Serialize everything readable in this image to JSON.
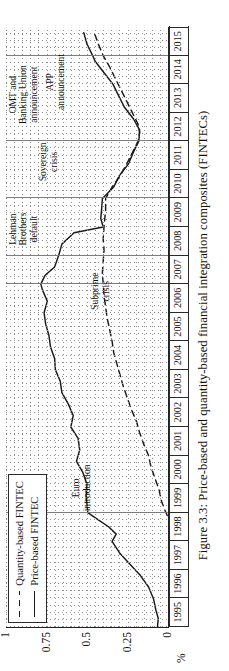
{
  "figure": {
    "caption": "Figure 3.3: Price-based and quantity-based financial integration composites (FINTECs)"
  },
  "legend": {
    "position": "upper-left",
    "items": [
      {
        "label": "Quantity-based FINTEC",
        "style": "dashed"
      },
      {
        "label": "Price-based FINTEC",
        "style": "solid"
      }
    ]
  },
  "annotations": [
    {
      "id": "euro-introduction",
      "text": "Euro\nintroduction",
      "year": 1999.05
    },
    {
      "id": "subprime-crisis",
      "text": "Subprime\ncrisis",
      "year": 2006.1
    },
    {
      "id": "lehman-brothers-default",
      "text": "Lehman\nBrothers\ndefault",
      "year": 2008.35
    },
    {
      "id": "sovereign-crisis",
      "text": "Sovereign\ncrisis",
      "year": 2010.6
    },
    {
      "id": "omt-banking-union",
      "text": "OMT and\nBanking Union\nannouncement",
      "year": 2012.6
    },
    {
      "id": "app-announcement",
      "text": "APP\nannouncement",
      "year": 2013.1
    }
  ],
  "chart_data": {
    "type": "line",
    "title": "",
    "xlabel": "",
    "ylabel": "%",
    "xlim": [
      1995,
      2016
    ],
    "ylim": [
      0,
      1
    ],
    "yticks": [
      0,
      0.25,
      0.5,
      0.75,
      1
    ],
    "ytick_labels": [
      "0",
      "0.25",
      "0.5",
      "0.75",
      "1"
    ],
    "categories": [
      "1995",
      "1996",
      "1997",
      "1998",
      "1999",
      "2000",
      "2001",
      "2002",
      "2003",
      "2004",
      "2005",
      "2006",
      "2007",
      "2008",
      "2009",
      "2010",
      "2011",
      "2012",
      "2013",
      "2014",
      "2015"
    ],
    "grid": "dotted",
    "event_lines": [
      1999,
      2007,
      2008,
      2010,
      2012,
      2015
    ],
    "series": [
      {
        "name": "Price-based FINTEC",
        "style": "solid",
        "x": [
          1995.0,
          1995.3,
          1995.6,
          1996.0,
          1996.4,
          1996.8,
          1997.2,
          1997.6,
          1998.0,
          1998.25,
          1998.5,
          1998.75,
          1999.0,
          1999.3,
          1999.6,
          2000.0,
          2000.4,
          2000.8,
          2001.2,
          2001.6,
          2002.0,
          2002.4,
          2002.8,
          2003.2,
          2003.6,
          2004.0,
          2004.4,
          2004.8,
          2005.2,
          2005.6,
          2006.0,
          2006.4,
          2006.8,
          2007.0,
          2007.3,
          2007.6,
          2008.0,
          2008.4,
          2008.8,
          2009.0,
          2009.3,
          2009.6,
          2010.0,
          2010.4,
          2010.8,
          2011.2,
          2011.6,
          2012.0,
          2012.4,
          2012.8,
          2013.2,
          2013.6,
          2014.0,
          2014.4,
          2014.8,
          2015.0,
          2015.4,
          2015.8
        ],
        "y": [
          0.065,
          0.06,
          0.075,
          0.09,
          0.12,
          0.17,
          0.235,
          0.3,
          0.345,
          0.32,
          0.365,
          0.43,
          0.495,
          0.5,
          0.505,
          0.5,
          0.525,
          0.565,
          0.545,
          0.555,
          0.6,
          0.585,
          0.615,
          0.655,
          0.665,
          0.695,
          0.7,
          0.725,
          0.735,
          0.755,
          0.765,
          0.745,
          0.775,
          0.785,
          0.76,
          0.7,
          0.675,
          0.655,
          0.58,
          0.4,
          0.415,
          0.41,
          0.405,
          0.335,
          0.3,
          0.245,
          0.215,
          0.18,
          0.175,
          0.215,
          0.27,
          0.305,
          0.34,
          0.395,
          0.45,
          0.465,
          0.5,
          0.52
        ]
      },
      {
        "name": "Quantity-based FINTEC",
        "style": "dashed",
        "x": [
          1998.9,
          1999.1,
          1999.4,
          1999.8,
          2000.2,
          2000.6,
          2001.0,
          2001.4,
          2001.8,
          2002.2,
          2002.6,
          2003.0,
          2003.4,
          2003.8,
          2004.2,
          2004.6,
          2005.0,
          2005.4,
          2005.8,
          2006.2,
          2006.6,
          2007.0,
          2007.4,
          2007.8,
          2008.2,
          2008.6,
          2009.0,
          2009.3,
          2009.6,
          2010.0,
          2010.4,
          2010.8,
          2011.2,
          2011.6,
          2012.0,
          2012.3,
          2012.6,
          2013.0,
          2013.4,
          2013.8,
          2014.2,
          2014.6,
          2015.0,
          2015.4,
          2015.8
        ],
        "y": [
          0.005,
          0.02,
          0.04,
          0.055,
          0.08,
          0.105,
          0.12,
          0.15,
          0.175,
          0.195,
          0.225,
          0.25,
          0.275,
          0.295,
          0.315,
          0.335,
          0.345,
          0.36,
          0.375,
          0.385,
          0.395,
          0.4,
          0.405,
          0.4,
          0.395,
          0.4,
          0.395,
          0.39,
          0.385,
          0.385,
          0.345,
          0.295,
          0.255,
          0.22,
          0.185,
          0.175,
          0.185,
          0.22,
          0.255,
          0.29,
          0.325,
          0.36,
          0.4,
          0.43,
          0.455
        ]
      }
    ]
  }
}
